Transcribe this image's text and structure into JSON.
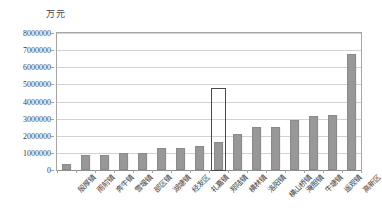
{
  "chart_data": {
    "type": "bar",
    "title": "",
    "unit_label": "万元",
    "xlabel": "",
    "ylabel": "",
    "ylim": [
      0,
      8000000
    ],
    "ytick_labels": [
      "8000000",
      "7000000",
      "6000000",
      "5000000",
      "4000000",
      "3000000",
      "2000000",
      "1000000",
      "0"
    ],
    "ytick_values": [
      8000000,
      7000000,
      6000000,
      5000000,
      4000000,
      3000000,
      2000000,
      1000000,
      0
    ],
    "grid": true,
    "legend": "none",
    "bar_color": "#989898",
    "highlight_color": "#4a4a4a",
    "highlight_index": 8,
    "categories": [
      "殷厚镇",
      "雨前镇",
      "奔牛镇",
      "雪堰镇",
      "部区镇",
      "湖塘镇",
      "经发区",
      "礼嘉镇",
      "郑陆镇",
      "横林镇",
      "洛阳镇",
      "横山桥镇",
      "淹胆镇",
      "牛塘镇",
      "遥观镇",
      "高新区"
    ],
    "values": [
      350000,
      850000,
      880000,
      1000000,
      1020000,
      1300000,
      1300000,
      1400000,
      1650000,
      2100000,
      2500000,
      2500000,
      2900000,
      3150000,
      3200000,
      6800000
    ]
  }
}
